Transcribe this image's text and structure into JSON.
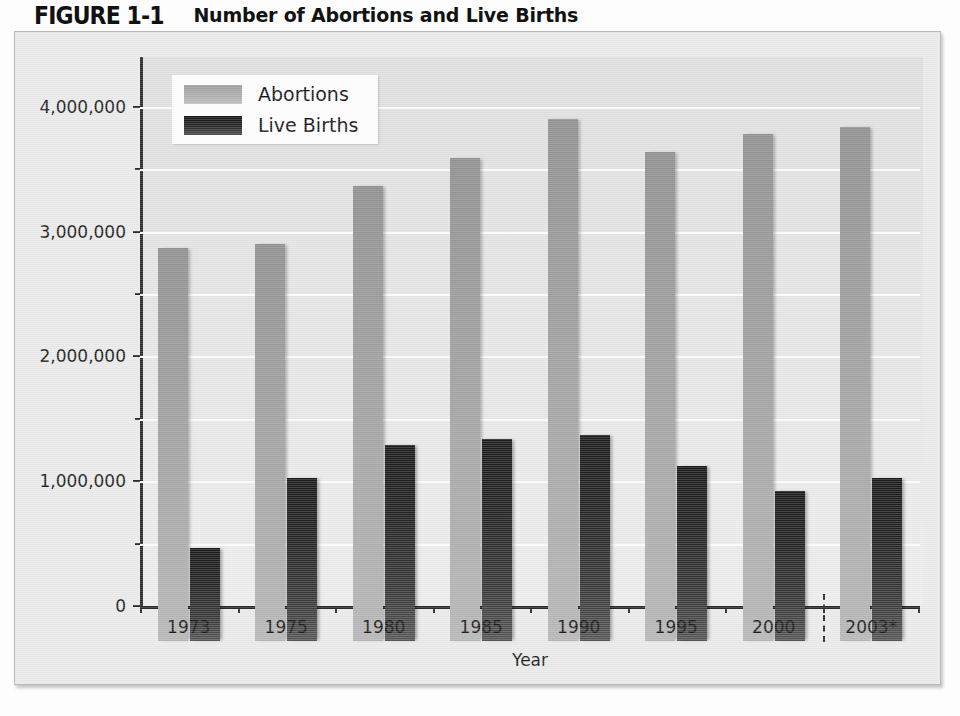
{
  "figure": {
    "label": "FIGURE 1-1",
    "title": "Number of Abortions and Live Births"
  },
  "chart_data": {
    "type": "bar",
    "title": "Number of Abortions and Live Births",
    "xlabel": "Year",
    "ylabel": "",
    "categories": [
      "1973",
      "1975",
      "1980",
      "1985",
      "1990",
      "1995",
      "2000",
      "2003*"
    ],
    "series": [
      {
        "name": "Abortions",
        "color": "#a5a5a5",
        "values": [
          3150000,
          3180000,
          3650000,
          3870000,
          4180000,
          3920000,
          4060000,
          4120000
        ]
      },
      {
        "name": "Live Births",
        "color": "#242424",
        "values": [
          745000,
          1310000,
          1570000,
          1620000,
          1650000,
          1400000,
          1200000,
          1310000
        ]
      }
    ],
    "ylim": [
      0,
      4400000
    ],
    "yticks": [
      0,
      1000000,
      2000000,
      3000000,
      4000000
    ],
    "ytick_labels": [
      "0",
      "1,000,000",
      "2,000,000",
      "3,000,000",
      "4,000,000"
    ],
    "minor_gridlines": true,
    "minor_tick_step": 500000,
    "grid": true,
    "legend_position": "top-left",
    "annotations": [
      {
        "type": "vertical-dashed-separator",
        "between": [
          "2000",
          "2003*"
        ],
        "meaning": "projected-estimate-divider"
      }
    ]
  },
  "legend": {
    "items": [
      {
        "label": "Abortions",
        "swatch": "abortions"
      },
      {
        "label": "Live Births",
        "swatch": "births"
      }
    ]
  },
  "axes": {
    "x_title": "Year"
  },
  "colors": {
    "plate_background": "#e9e9e9",
    "plot_background": "#e4e4e4",
    "gridline": "#fbfbfb",
    "axis": "#2a2a2a",
    "abortions_bar": "#a5a5a5",
    "births_bar": "#242424"
  }
}
